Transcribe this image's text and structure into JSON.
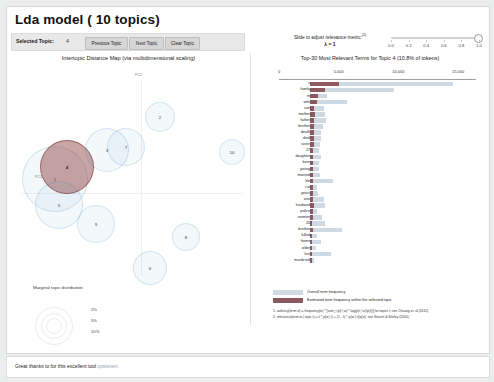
{
  "header": {
    "title": "Lda model ( 10 topics)",
    "selected_topic_label": "Selected Topic:",
    "selected_topic_value": "4",
    "buttons": [
      {
        "name": "previous-topic",
        "label": "Previous Topic"
      },
      {
        "name": "next-topic",
        "label": "Next Topic"
      },
      {
        "name": "clear-topic",
        "label": "Clear Topic"
      }
    ]
  },
  "slider": {
    "label": "Slide to adjust relevance metric:",
    "footnote_marker": "(2)",
    "lambda_text": "λ = 1",
    "value": 1.0,
    "ticks": [
      "0.0",
      "0.2",
      "0.4",
      "0.6",
      "0.8",
      "1.0"
    ]
  },
  "left_panel": {
    "title": "Intertopic Distance Map (via multidimensional scaling)",
    "axis_x_label": "PC1",
    "axis_y_label": "PC2",
    "marginal_title": "Marginal topic distribution",
    "marginal_ticks": [
      "2%",
      "5%",
      "10%"
    ],
    "topics": [
      {
        "id": "1",
        "x": 48,
        "y": 100,
        "r": 33,
        "selected": false
      },
      {
        "id": "4",
        "x": 60,
        "y": 88,
        "r": 27,
        "selected": true
      },
      {
        "id": "5",
        "x": 52,
        "y": 126,
        "r": 24,
        "selected": false
      },
      {
        "id": "3",
        "x": 100,
        "y": 71,
        "r": 22,
        "selected": false
      },
      {
        "id": "7",
        "x": 119,
        "y": 68,
        "r": 19,
        "selected": false
      },
      {
        "id": "2",
        "x": 153,
        "y": 38,
        "r": 15,
        "selected": false
      },
      {
        "id": "10",
        "x": 225,
        "y": 73,
        "r": 13,
        "selected": false
      },
      {
        "id": "9",
        "x": 89,
        "y": 145,
        "r": 19,
        "selected": false
      },
      {
        "id": "8",
        "x": 179,
        "y": 158,
        "r": 14,
        "selected": false
      },
      {
        "id": "6",
        "x": 143,
        "y": 189,
        "r": 17,
        "selected": false
      }
    ]
  },
  "chart_data": {
    "type": "bar",
    "title": "Top-30 Most Relevant Terms for Topic 4 (10.8% of tokens)",
    "xlabel": "",
    "ylabel": "",
    "xlim": [
      0,
      16500
    ],
    "ticks": [
      0,
      5000,
      10000,
      15000
    ],
    "tick_labels": [
      "0",
      "5,000",
      "10,000",
      "15,000"
    ],
    "grid": false,
    "legend_position": "bottom",
    "series": [
      {
        "name": "Overall term frequency",
        "color": "#cfd9e4"
      },
      {
        "name": "Estimated term frequency within the selected topic",
        "color": "#8c5a5e"
      }
    ],
    "categories": [
      "s",
      "family",
      "m",
      "wife",
      "son",
      "mother",
      "father",
      "brother",
      "death",
      "died",
      "sister",
      "27",
      "daughter",
      "born",
      "young",
      "married",
      "life",
      "cut",
      "years",
      "one",
      "husband",
      "police",
      "women",
      "20",
      "brother",
      "killed",
      "home",
      "older",
      "live",
      "murdered"
    ],
    "overall": [
      14200,
      8300,
      1700,
      3700,
      1400,
      1500,
      1600,
      1300,
      1100,
      1050,
      1000,
      900,
      1100,
      900,
      850,
      950,
      2300,
      700,
      800,
      1350,
      1450,
      650,
      1200,
      1500,
      3200,
      700,
      1050,
      600,
      2100,
      380
    ],
    "topic": [
      2900,
      1500,
      820,
      700,
      420,
      450,
      440,
      420,
      400,
      380,
      370,
      340,
      330,
      320,
      310,
      300,
      300,
      290,
      280,
      270,
      420,
      250,
      250,
      240,
      250,
      230,
      220,
      210,
      200,
      190
    ]
  },
  "legend": {
    "overall": "Overall term frequency",
    "topic": "Estimated term frequency within the selected topic",
    "footnotes": [
      "1. saliency(term w) = frequency(w) * [sum_t p(t | w) * log(p(t | w)/p(t))] for topics t; see Chuang et. al (2012)",
      "2. relevance(term w | topic t) = λ * p(w | t) + (1 - λ) * p(w | t)/p(w); see Sievert & Shirley (2014)"
    ]
  },
  "footer": {
    "text": "Great thanks to for this excellent tool ",
    "link": "cpsievert"
  }
}
